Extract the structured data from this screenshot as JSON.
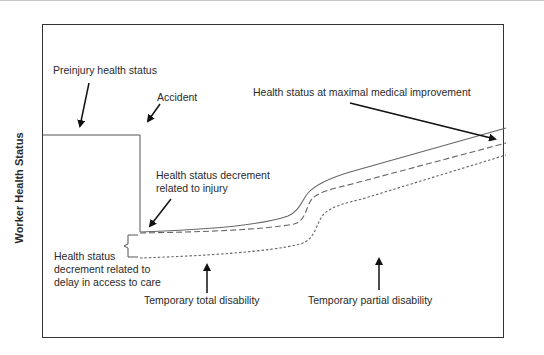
{
  "diagram": {
    "y_axis_label": "Worker Health Status",
    "annotations": {
      "preinjury": "Preinjury health status",
      "accident": "Accident",
      "mmi": "Health status at maximal medical improvement",
      "injury_decrement_line1": "Health status decrement",
      "injury_decrement_line2": "related to injury",
      "delay_line1": "Health status",
      "delay_line2": "decrement related to",
      "delay_line3": "delay in access to care",
      "ttd": "Temporary total disability",
      "tpd": "Temporary partial disability"
    },
    "curves": [
      {
        "name": "health-trajectory-prompt-care",
        "style": "solid"
      },
      {
        "name": "health-trajectory-intermediate",
        "style": "dashed"
      },
      {
        "name": "health-trajectory-delayed-care",
        "style": "dotted"
      }
    ],
    "colors": {
      "frame": "#333333",
      "curves": "#555555",
      "arrows": "#111111",
      "text": "#2a2a2a"
    }
  }
}
